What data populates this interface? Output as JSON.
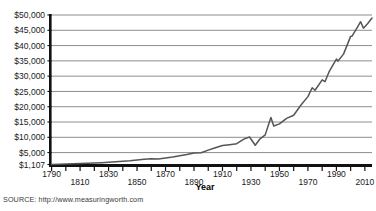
{
  "figure": {
    "source_note": "SOURCE: http://www.measuringworth.com",
    "title_clipped": "Real GDP per capita (2010 dollars)",
    "axis_line_color": "#111111",
    "grid_color": "#8d8d8d",
    "series_color": "#555555",
    "background": "#ffffff"
  },
  "chart_data": {
    "type": "line",
    "title": "Real GDP per capita (2010 dollars)",
    "xlabel": "Year",
    "ylabel": "",
    "xlim": [
      1790,
      2015
    ],
    "ylim": [
      1107,
      50000
    ],
    "grid": true,
    "legend": false,
    "legend_position": "none",
    "xticks_major": [
      1790,
      1810,
      1830,
      1850,
      1870,
      1890,
      1910,
      1930,
      1950,
      1970,
      1990,
      2010
    ],
    "xtick_labels": [
      "1790",
      "1810",
      "1830",
      "1850",
      "1870",
      "1890",
      "1910",
      "1930",
      "1950",
      "1970",
      "1990",
      "2010"
    ],
    "xtick_minor_step": 10,
    "yticks": [
      1107,
      5000,
      10000,
      15000,
      20000,
      25000,
      30000,
      35000,
      40000,
      45000,
      50000
    ],
    "ytick_labels": [
      "$1,107",
      "$5,000",
      "$10,000",
      "$15,000",
      "$20,000",
      "$25,000",
      "$30,000",
      "$35,000",
      "$40,000",
      "$45,000",
      "$50,000"
    ],
    "series": [
      {
        "name": "Real GDP per capita",
        "x": [
          1790,
          1795,
          1800,
          1805,
          1810,
          1815,
          1820,
          1825,
          1830,
          1835,
          1840,
          1845,
          1850,
          1855,
          1860,
          1865,
          1870,
          1875,
          1880,
          1885,
          1890,
          1895,
          1900,
          1905,
          1910,
          1915,
          1920,
          1925,
          1929,
          1933,
          1936,
          1940,
          1944,
          1946,
          1950,
          1955,
          1960,
          1965,
          1970,
          1973,
          1975,
          1980,
          1982,
          1985,
          1990,
          1991,
          1995,
          2000,
          2001,
          2005,
          2007,
          2009,
          2012,
          2015
        ],
        "values": [
          1107,
          1180,
          1250,
          1330,
          1400,
          1500,
          1580,
          1700,
          1850,
          2000,
          2150,
          2320,
          2600,
          2800,
          3000,
          2900,
          3200,
          3550,
          4000,
          4350,
          4900,
          4950,
          5800,
          6600,
          7300,
          7600,
          7900,
          9400,
          10100,
          7400,
          9300,
          10800,
          16500,
          13700,
          14400,
          16200,
          17200,
          20500,
          23300,
          26200,
          25400,
          28800,
          28200,
          31600,
          35600,
          34900,
          37200,
          43000,
          43100,
          46200,
          47800,
          45700,
          47200,
          49000
        ]
      }
    ],
    "annotations": [
      {
        "label": "Great Depression trough",
        "x": 1933,
        "y": 7400
      },
      {
        "label": "WWII peak",
        "x": 1944,
        "y": 16500
      }
    ]
  }
}
